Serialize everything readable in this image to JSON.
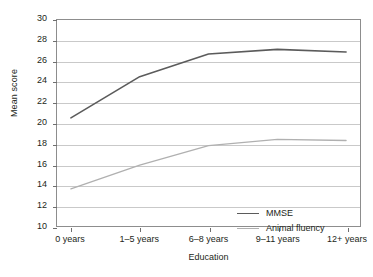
{
  "chart_data": {
    "type": "line",
    "title": "",
    "xlabel": "Education",
    "ylabel": "Mean score",
    "categories": [
      "0 years",
      "1–5 years",
      "6–8 years",
      "9–11 years",
      "12+ years"
    ],
    "ylim": [
      10,
      30
    ],
    "yticks": [
      10,
      12,
      14,
      16,
      18,
      20,
      22,
      24,
      26,
      28,
      30
    ],
    "grid": true,
    "legend_position": "inside-lower-right",
    "series": [
      {
        "name": "MMSE",
        "color": "#5b5b5b",
        "values": [
          20.5,
          24.5,
          26.7,
          27.15,
          26.9
        ]
      },
      {
        "name": "Animal fluency",
        "color": "#b0b0b0",
        "values": [
          13.6,
          15.9,
          17.8,
          18.4,
          18.3
        ]
      }
    ]
  },
  "legend": {
    "items": [
      {
        "label": "MMSE",
        "color": "#5b5b5b"
      },
      {
        "label": "Animal fluency",
        "color": "#b0b0b0"
      }
    ]
  }
}
